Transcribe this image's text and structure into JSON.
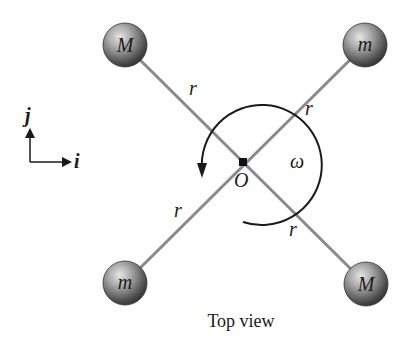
{
  "diagram": {
    "caption": "Top view",
    "center_label": "O",
    "angular_velocity_label": "ω",
    "axes": {
      "x_label": "i",
      "y_label": "j"
    },
    "arm_label": "r",
    "arms": [
      {
        "id": "top-left",
        "mass_label": "M",
        "radius_label": "r"
      },
      {
        "id": "top-right",
        "mass_label": "m",
        "radius_label": "r"
      },
      {
        "id": "bottom-left",
        "mass_label": "m",
        "radius_label": "r"
      },
      {
        "id": "bottom-right",
        "mass_label": "M",
        "radius_label": "r"
      }
    ],
    "colors": {
      "rod": "#8a8a8a",
      "ink": "#1a1a1a",
      "ball_light": "#d8d8d8",
      "ball_dark": "#3a3a3a"
    }
  }
}
